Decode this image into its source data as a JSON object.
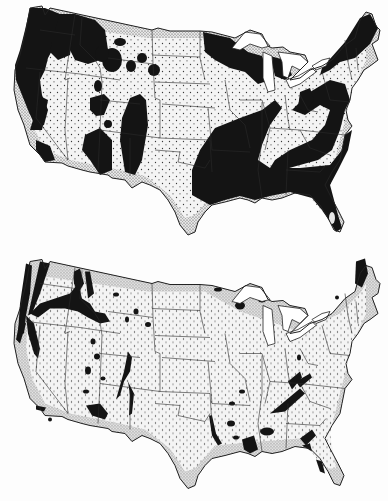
{
  "figure": {
    "alt": "Two stippled maps of the contiguous United States; black areas mark mapped regions",
    "colors": {
      "background": "#fdfdfd",
      "land": "#f4f4f4",
      "stipple": "#3a3a3a",
      "coast_shade": "#9a9a9a",
      "region": "#141414",
      "borders": "#2a2a2a",
      "lakes": "#ffffff"
    }
  },
  "maps": [
    {
      "id": "top",
      "description": "Extensive black regions: Pacific Northwest, northern Rockies, Colorado/Utah blobs, upper Great Lakes, and a broad band across the South and Appalachians to Maine"
    },
    {
      "id": "bottom",
      "description": "Narrow black streaks: Cascade/Sierra corridors, Snake River plain, Rio Grande valley, scattered small patches in the Southeast, Florida and northern Maine"
    }
  ]
}
